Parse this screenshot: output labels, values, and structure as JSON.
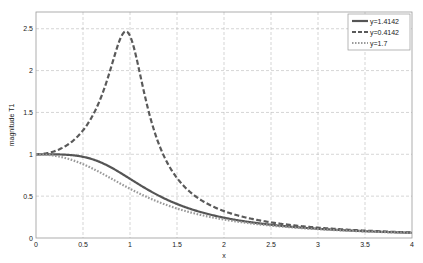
{
  "chart_data": {
    "type": "line",
    "title": "",
    "xlabel": "x",
    "ylabel": "magnitude T1",
    "xlim": [
      0,
      4
    ],
    "ylim": [
      0,
      2.7
    ],
    "grid": true,
    "legend_position": "upper right",
    "x_ticks": [
      "0",
      "0.5",
      "1",
      "1.5",
      "2",
      "2.5",
      "3",
      "3.5",
      "4"
    ],
    "y_ticks": [
      "0",
      "0.5",
      "1",
      "1.5",
      "2",
      "2.5"
    ],
    "x": [
      0,
      0.25,
      0.5,
      0.75,
      1,
      1.25,
      1.5,
      2,
      2.5,
      3,
      3.5,
      4
    ],
    "series": [
      {
        "name": "y=1.4142",
        "param": 1.4142,
        "style": "solid",
        "color": "#555555",
        "values": [
          1.0,
          0.998,
          0.97,
          0.872,
          0.707,
          0.539,
          0.406,
          0.243,
          0.158,
          0.11,
          0.081,
          0.062
        ]
      },
      {
        "name": "y=0.4142",
        "param": 0.4142,
        "style": "dashed",
        "color": "#5a5a5a",
        "values": [
          1.0,
          1.06,
          1.285,
          1.864,
          2.414,
          1.308,
          0.716,
          0.321,
          0.187,
          0.124,
          0.088,
          0.066
        ],
        "peak": {
          "x": 0.95,
          "y": 2.47
        }
      },
      {
        "name": "y=1.7",
        "param": 1.7,
        "style": "dotted",
        "color": "#9a9a9a",
        "values": [
          1.0,
          0.972,
          0.882,
          0.742,
          0.588,
          0.455,
          0.352,
          0.221,
          0.148,
          0.105,
          0.079,
          0.061
        ]
      }
    ]
  }
}
